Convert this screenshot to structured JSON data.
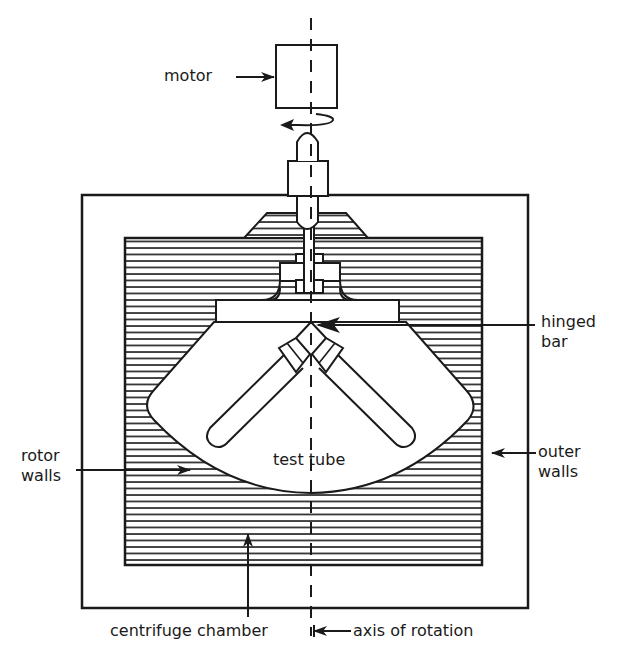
{
  "diagram": {
    "subject": "centrifuge",
    "colors": {
      "line": "#1a1a1a",
      "background": "#ffffff"
    },
    "labels": {
      "motor": "motor",
      "hinged_bar": "hinged\nbar",
      "rotor_walls": "rotor\nwalls",
      "test_tube": "test tube",
      "outer_walls": "outer\nwalls",
      "centrifuge_chamber": "centrifuge chamber",
      "axis_of_rotation": "axis of rotation"
    },
    "components": [
      "motor",
      "drive shaft",
      "coupling",
      "hub",
      "hinged bar",
      "rotor walls",
      "test tube (left)",
      "test tube (right)",
      "centrifuge chamber",
      "outer walls",
      "axis of rotation"
    ]
  }
}
